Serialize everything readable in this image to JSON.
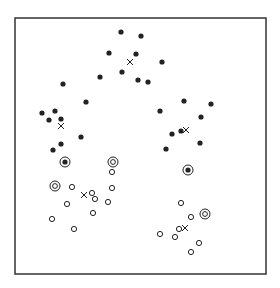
{
  "chart_data": {
    "type": "scatter",
    "title": "",
    "xlabel": "",
    "ylabel": "",
    "grid": false,
    "legend": null,
    "frame": {
      "x0": 15,
      "y0": 18,
      "x1": 266,
      "y1": 274
    },
    "coordinate_note": "pixel coordinates within 280x288 image",
    "series": [
      {
        "name": "class-filled",
        "marker": "filled-circle",
        "points": [
          [
            121,
            32
          ],
          [
            141,
            36
          ],
          [
            109,
            53
          ],
          [
            136,
            54
          ],
          [
            162,
            62
          ],
          [
            122,
            72
          ],
          [
            100,
            77
          ],
          [
            138,
            80
          ],
          [
            148,
            82
          ],
          [
            63,
            84
          ],
          [
            86,
            102
          ],
          [
            42,
            113
          ],
          [
            55,
            111
          ],
          [
            49,
            120
          ],
          [
            61,
            119
          ],
          [
            81,
            137
          ],
          [
            61,
            144
          ],
          [
            53,
            150
          ],
          [
            184,
            101
          ],
          [
            211,
            104
          ],
          [
            160,
            111
          ],
          [
            201,
            117
          ],
          [
            181,
            131
          ],
          [
            172,
            134
          ],
          [
            200,
            143
          ],
          [
            166,
            149
          ]
        ]
      },
      {
        "name": "class-hollow",
        "marker": "open-circle",
        "points": [
          [
            112,
            172
          ],
          [
            72,
            187
          ],
          [
            112,
            188
          ],
          [
            92,
            193
          ],
          [
            95,
            199
          ],
          [
            67,
            204
          ],
          [
            108,
            202
          ],
          [
            93,
            213
          ],
          [
            52,
            219
          ],
          [
            74,
            229
          ],
          [
            181,
            203
          ],
          [
            191,
            217
          ],
          [
            179,
            229
          ],
          [
            160,
            234
          ],
          [
            175,
            237
          ],
          [
            199,
            243
          ],
          [
            191,
            252
          ]
        ]
      },
      {
        "name": "support-filled",
        "marker": "ringed-filled-circle",
        "points": [
          [
            65,
            162
          ],
          [
            188,
            170
          ]
        ]
      },
      {
        "name": "support-hollow",
        "marker": "double-ring",
        "points": [
          [
            113,
            162
          ],
          [
            55,
            186
          ],
          [
            205,
            214
          ]
        ]
      },
      {
        "name": "centroids",
        "marker": "x",
        "points": [
          [
            130,
            62
          ],
          [
            61,
            126
          ],
          [
            186,
            130
          ],
          [
            84,
            195
          ],
          [
            185,
            228
          ]
        ]
      }
    ]
  },
  "colors": {
    "ink": "#222222",
    "frame": "#333333",
    "background": "#ffffff"
  }
}
